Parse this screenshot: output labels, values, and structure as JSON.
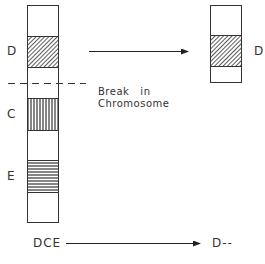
{
  "diagram": {
    "type": "chromosome-deletion",
    "left_chromosome": {
      "bands": [
        {
          "label": "D",
          "pattern": "diagonal-hatch"
        },
        {
          "label": "C",
          "pattern": "vertical-lines"
        },
        {
          "label": "E",
          "pattern": "horizontal-lines"
        }
      ]
    },
    "right_chromosome": {
      "bands": [
        {
          "label": "D",
          "pattern": "diagonal-hatch"
        }
      ]
    },
    "break_annotation": {
      "line1": "Break   in",
      "line2": "Chromosome"
    },
    "bottom_sequence": {
      "before": "DCE",
      "after": "D--"
    }
  }
}
